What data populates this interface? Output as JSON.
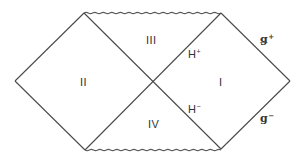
{
  "diagram": {
    "type": "penrose-diagram",
    "regions": [
      {
        "id": "I",
        "label": "I"
      },
      {
        "id": "II",
        "label": "II"
      },
      {
        "id": "III",
        "label": "III"
      },
      {
        "id": "IV",
        "label": "IV"
      }
    ],
    "horizons": {
      "future": {
        "base": "H",
        "sup": "+"
      },
      "past": {
        "base": "H",
        "sup": "−"
      }
    },
    "null_infinity": {
      "future": {
        "base": "ǥ",
        "sup": "+"
      },
      "past": {
        "base": "g",
        "sup": "−"
      }
    },
    "colors": {
      "line": "#4a4a4a",
      "text": "#333333",
      "background": "#ffffff"
    }
  }
}
